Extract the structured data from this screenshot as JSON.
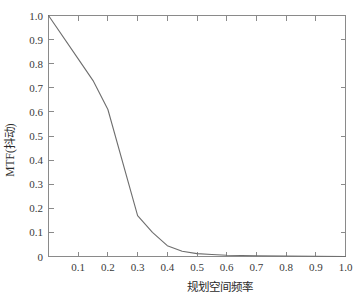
{
  "chart_data": {
    "type": "line",
    "title": "",
    "subtitle": "",
    "xlabel": "规划空间频率",
    "ylabel": "MTF(抖动)",
    "xlim": [
      0,
      1.0
    ],
    "ylim": [
      0,
      1.0
    ],
    "grid": false,
    "legend": null,
    "legend_position": "none",
    "line_color": "#6e6e6e",
    "axis_color": "#8a8a8a",
    "x": [
      0.0,
      0.1,
      0.15,
      0.2,
      0.3,
      0.35,
      0.4,
      0.45,
      0.5,
      0.55,
      0.6,
      0.7,
      0.8,
      0.9,
      1.0
    ],
    "y": [
      1.0,
      0.82,
      0.73,
      0.61,
      0.17,
      0.1,
      0.045,
      0.022,
      0.012,
      0.008,
      0.005,
      0.003,
      0.002,
      0.001,
      0.0
    ],
    "series": [
      {
        "name": "MTF(抖动)",
        "values": [
          1.0,
          0.82,
          0.73,
          0.61,
          0.17,
          0.1,
          0.045,
          0.022,
          0.012,
          0.008,
          0.005,
          0.003,
          0.002,
          0.001,
          0.0
        ]
      }
    ],
    "x_ticks": [
      0,
      0.1,
      0.2,
      0.3,
      0.4,
      0.5,
      0.6,
      0.7,
      0.8,
      0.9,
      1.0
    ],
    "x_tick_labels": [
      "",
      "0.1",
      "0.2",
      "0.3",
      "0.4",
      "0.5",
      "0.6",
      "0.7",
      "0.8",
      "0.9",
      "1.0"
    ],
    "y_ticks": [
      0,
      0.1,
      0.2,
      0.3,
      0.4,
      0.5,
      0.6,
      0.7,
      0.8,
      0.9,
      1.0
    ],
    "y_tick_labels": [
      "0",
      "0.1",
      "0.2",
      "0.3",
      "0.4",
      "0.5",
      "0.6",
      "0.7",
      "0.8",
      "0.9",
      "1.0"
    ],
    "annotations": []
  },
  "labels": {
    "y_1_0": "1.0",
    "y_0_9": "0.9",
    "y_0_8": "0.8",
    "y_0_7": "0.7",
    "y_0_6": "0.6",
    "y_0_5": "0.5",
    "y_0_4": "0.4",
    "y_0_3": "0.3",
    "y_0_2": "0.2",
    "y_0_1": "0.1",
    "y_0": "0",
    "x_0_1": "0.1",
    "x_0_2": "0.2",
    "x_0_3": "0.3",
    "x_0_4": "0.4",
    "x_0_5": "0.5",
    "x_0_6": "0.6",
    "x_0_7": "0.7",
    "x_0_8": "0.8",
    "x_0_9": "0.9",
    "x_1_0": "1.0",
    "xlabel": "规划空间频率",
    "ylabel": "MTF(抖动)"
  }
}
